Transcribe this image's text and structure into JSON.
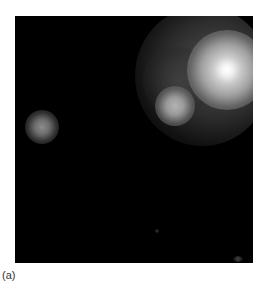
{
  "figure": {
    "caption": "(a)",
    "background_color": "#000000",
    "sources": [
      {
        "name": "main-bright-source",
        "approx_center": [
          227,
          70
        ]
      },
      {
        "name": "secondary-source",
        "approx_center": [
          174,
          106
        ]
      },
      {
        "name": "left-faint-source",
        "approx_center": [
          41,
          126
        ]
      }
    ]
  }
}
